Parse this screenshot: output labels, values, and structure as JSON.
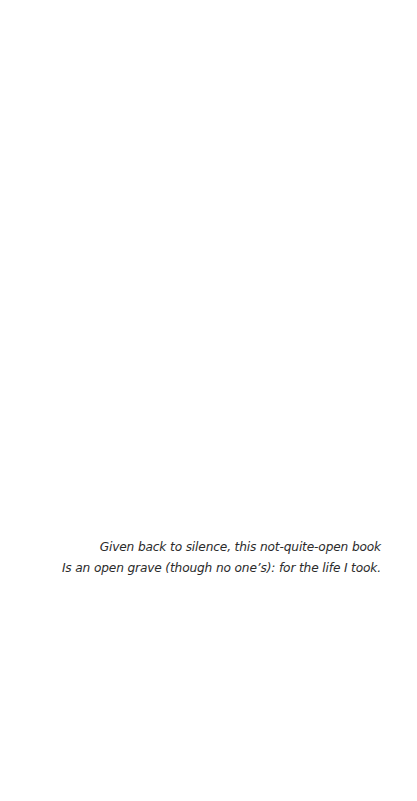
{
  "page": {
    "background": "#ffffff",
    "text_color": "#2b2b2b"
  },
  "epigraph": {
    "lines": [
      "Given back to silence, this not-quite-open book",
      "Is an open grave (though no one’s): for the life I took."
    ]
  }
}
